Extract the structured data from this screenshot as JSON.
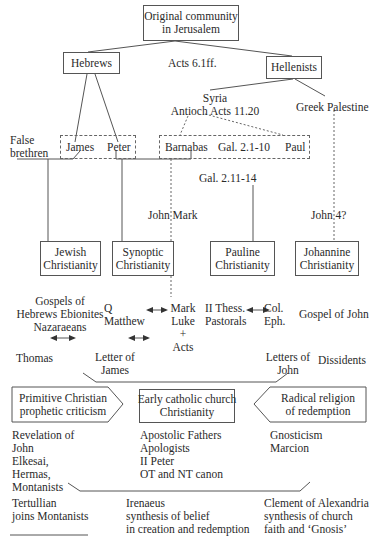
{
  "nodes": {
    "root": "Original community\nin Jerusalem",
    "hebrews": "Hebrews",
    "acts6": "Acts 6.1ff.",
    "hellenists": "Hellenists",
    "syria": "Syria\nAntioch Acts 11.20",
    "greek_palestine": "Greek Palestine",
    "false_brethren": "False\nbrethren",
    "james": "James",
    "peter": "Peter",
    "barnabas": "Barnabas",
    "gal_2_1_10": "Gal. 2.1-10",
    "paul": "Paul",
    "gal_2_11_14": "Gal. 2.11-14",
    "john_mark": "John Mark",
    "john4": "John 4?",
    "jewish_christianity": "Jewish\nChristianity",
    "synoptic_christianity": "Synoptic\nChristianity",
    "pauline_christianity": "Pauline\nChristianity",
    "johannine_christianity": "Johannine\nChristianity",
    "gospels_hebrews": "Gospels of\nHebrews Ebionites\nNazaraeans",
    "q_matthew": "Q\nMatthew",
    "mark_luke_acts": "Mark\nLuke\n+\nActs",
    "thess_pastorals": "II Thess.\nPastorals",
    "col_eph": "Col.\nEph.",
    "gospel_of_john": "Gospel of John",
    "thomas": "Thomas",
    "letter_of_james": "Letter of\nJames",
    "letters_of_john": "Letters of\nJohn",
    "dissidents": "Dissidents",
    "primitive_christian": "Primitive Christian\nprophetic criticism",
    "early_catholic": "Early catholic church\nChristianity",
    "radical_religion": "Radical religion\nof redemption",
    "primitive_list": "Revelation of\nJohn\nElkesai,\nHermas,\nMontanists",
    "catholic_list": "Apostolic Fathers\nApologists\nII Peter\nOT and NT canon",
    "radical_list": "Gnosticism\nMarcion",
    "tertullian": "Tertullian\njoins Montanists",
    "irenaeus": "Irenaeus\nsynthesis of belief\nin creation and redemption",
    "clement": "Clement of Alexandria\nsynthesis of church\nfaith and ‘Gnosis’"
  },
  "colors": {
    "line": "#555555",
    "text": "#2a2a2a",
    "background": "#ffffff"
  }
}
